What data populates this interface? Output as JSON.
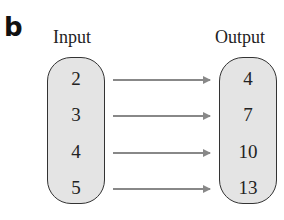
{
  "panel_label": "b",
  "input": {
    "title": "Input",
    "values": [
      "2",
      "3",
      "4",
      "5"
    ]
  },
  "output": {
    "title": "Output",
    "values": [
      "4",
      "7",
      "10",
      "13"
    ]
  },
  "mapping": [
    {
      "from": "2",
      "to": "4"
    },
    {
      "from": "3",
      "to": "7"
    },
    {
      "from": "4",
      "to": "10"
    },
    {
      "from": "5",
      "to": "13"
    }
  ],
  "colors": {
    "oval_fill": "#e4e4e4",
    "oval_stroke": "#333333",
    "arrow": "#888888"
  }
}
